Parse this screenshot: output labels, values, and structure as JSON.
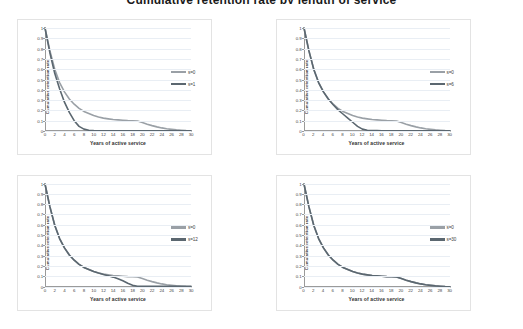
{
  "page": {
    "title": "Cumulative retention rate by length of service",
    "background": "#ffffff"
  },
  "axis": {
    "y_title": "Cumulative retention rate",
    "x_title": "Years of active service",
    "y_ticks": [
      "1",
      "0.9",
      "0.8",
      "0.7",
      "0.6",
      "0.5",
      "0.4",
      "0.3",
      "0.2",
      "0.1",
      "0"
    ],
    "x_ticks": [
      "0",
      "2",
      "4",
      "6",
      "8",
      "10",
      "12",
      "14",
      "16",
      "18",
      "20",
      "22",
      "24",
      "26",
      "28",
      "30"
    ],
    "ylim": [
      0,
      1
    ],
    "xlim": [
      0,
      30
    ],
    "grid": true
  },
  "colors": {
    "series_a": "#9aa0a6",
    "series_b": "#5b6770",
    "gridline": "#e9eef4",
    "axis": "#9a9a9a",
    "frame": "#e3e3e3",
    "text": "#3f3f3f"
  },
  "chart_data": [
    {
      "type": "line",
      "panel": "top-left",
      "title": "",
      "xlabel": "Years of active service",
      "ylabel": "Cumulative retention rate",
      "xlim": [
        0,
        30
      ],
      "ylim": [
        0,
        1
      ],
      "grid": true,
      "legend_position": "right",
      "x": [
        0,
        1,
        2,
        3,
        4,
        5,
        6,
        7,
        8,
        9,
        10,
        11,
        12,
        13,
        14,
        15,
        16,
        17,
        18,
        19,
        20,
        21,
        22,
        23,
        24,
        25,
        26,
        27,
        28,
        29,
        30
      ],
      "series": [
        {
          "name": "s=0",
          "color": "#9aa0a6",
          "values": [
            1.0,
            0.78,
            0.6,
            0.47,
            0.38,
            0.31,
            0.26,
            0.22,
            0.19,
            0.17,
            0.15,
            0.135,
            0.125,
            0.118,
            0.112,
            0.108,
            0.104,
            0.101,
            0.099,
            0.097,
            0.082,
            0.066,
            0.052,
            0.04,
            0.03,
            0.022,
            0.016,
            0.011,
            0.007,
            0.004,
            0.002
          ]
        },
        {
          "name": "s=1",
          "color": "#5b6770",
          "values": [
            1.0,
            0.76,
            0.56,
            0.41,
            0.28,
            0.18,
            0.1,
            0.045,
            0.018,
            0.008,
            0.004,
            0.003,
            0.002,
            0.002,
            0.002,
            0.002,
            0.002,
            0.002,
            0.002,
            0.002,
            0.002,
            0.002,
            0.002,
            0.002,
            0.002,
            0.002,
            0.002,
            0.002,
            0.002,
            0.002,
            0.002
          ]
        }
      ]
    },
    {
      "type": "line",
      "panel": "top-right",
      "title": "",
      "xlabel": "Years of active service",
      "ylabel": "Cumulative retention rate",
      "xlim": [
        0,
        30
      ],
      "ylim": [
        0,
        1
      ],
      "grid": true,
      "legend_position": "right",
      "x": [
        0,
        1,
        2,
        3,
        4,
        5,
        6,
        7,
        8,
        9,
        10,
        11,
        12,
        13,
        14,
        15,
        16,
        17,
        18,
        19,
        20,
        21,
        22,
        23,
        24,
        25,
        26,
        27,
        28,
        29,
        30
      ],
      "series": [
        {
          "name": "s=0",
          "color": "#9aa0a6",
          "values": [
            1.0,
            0.78,
            0.6,
            0.47,
            0.38,
            0.31,
            0.26,
            0.22,
            0.19,
            0.17,
            0.15,
            0.135,
            0.125,
            0.118,
            0.112,
            0.108,
            0.104,
            0.101,
            0.099,
            0.097,
            0.082,
            0.066,
            0.052,
            0.04,
            0.03,
            0.022,
            0.016,
            0.011,
            0.007,
            0.004,
            0.002
          ]
        },
        {
          "name": "s=6",
          "color": "#5b6770",
          "values": [
            1.0,
            0.78,
            0.6,
            0.47,
            0.38,
            0.31,
            0.255,
            0.205,
            0.165,
            0.125,
            0.085,
            0.045,
            0.018,
            0.008,
            0.005,
            0.004,
            0.003,
            0.003,
            0.003,
            0.003,
            0.003,
            0.003,
            0.003,
            0.003,
            0.003,
            0.003,
            0.003,
            0.003,
            0.003,
            0.003,
            0.003
          ]
        }
      ]
    },
    {
      "type": "line",
      "panel": "bottom-left",
      "title": "",
      "xlabel": "Years of active service",
      "ylabel": "Cumulative retention rate",
      "xlim": [
        0,
        30
      ],
      "ylim": [
        0,
        1
      ],
      "grid": true,
      "legend_position": "right",
      "x": [
        0,
        1,
        2,
        3,
        4,
        5,
        6,
        7,
        8,
        9,
        10,
        11,
        12,
        13,
        14,
        15,
        16,
        17,
        18,
        19,
        20,
        21,
        22,
        23,
        24,
        25,
        26,
        27,
        28,
        29,
        30
      ],
      "series": [
        {
          "name": "s=0",
          "color": "#9aa0a6",
          "values": [
            1.0,
            0.78,
            0.6,
            0.47,
            0.38,
            0.31,
            0.26,
            0.22,
            0.19,
            0.17,
            0.15,
            0.135,
            0.125,
            0.118,
            0.112,
            0.108,
            0.104,
            0.101,
            0.099,
            0.097,
            0.082,
            0.066,
            0.052,
            0.04,
            0.03,
            0.022,
            0.016,
            0.011,
            0.007,
            0.004,
            0.002
          ]
        },
        {
          "name": "s=12",
          "color": "#5b6770",
          "values": [
            1.0,
            0.78,
            0.6,
            0.47,
            0.38,
            0.31,
            0.26,
            0.22,
            0.19,
            0.17,
            0.15,
            0.135,
            0.122,
            0.11,
            0.096,
            0.08,
            0.06,
            0.036,
            0.016,
            0.008,
            0.006,
            0.006,
            0.006,
            0.006,
            0.006,
            0.006,
            0.006,
            0.006,
            0.006,
            0.006,
            0.006
          ]
        }
      ]
    },
    {
      "type": "line",
      "panel": "bottom-right",
      "title": "",
      "xlabel": "Years of active service",
      "ylabel": "Cumulative retention rate",
      "xlim": [
        0,
        30
      ],
      "ylim": [
        0,
        1
      ],
      "grid": true,
      "legend_position": "right",
      "x": [
        0,
        1,
        2,
        3,
        4,
        5,
        6,
        7,
        8,
        9,
        10,
        11,
        12,
        13,
        14,
        15,
        16,
        17,
        18,
        19,
        20,
        21,
        22,
        23,
        24,
        25,
        26,
        27,
        28,
        29,
        30
      ],
      "series": [
        {
          "name": "s=0",
          "color": "#9aa0a6",
          "values": [
            1.0,
            0.78,
            0.6,
            0.47,
            0.38,
            0.31,
            0.26,
            0.22,
            0.19,
            0.17,
            0.15,
            0.135,
            0.125,
            0.118,
            0.112,
            0.108,
            0.104,
            0.101,
            0.099,
            0.097,
            0.082,
            0.066,
            0.052,
            0.04,
            0.03,
            0.022,
            0.016,
            0.011,
            0.007,
            0.004,
            0.002
          ]
        },
        {
          "name": "s=30",
          "color": "#5b6770",
          "values": [
            1.0,
            0.78,
            0.6,
            0.47,
            0.38,
            0.31,
            0.26,
            0.22,
            0.19,
            0.17,
            0.15,
            0.135,
            0.125,
            0.118,
            0.112,
            0.108,
            0.104,
            0.101,
            0.099,
            0.097,
            0.082,
            0.066,
            0.052,
            0.04,
            0.03,
            0.022,
            0.016,
            0.011,
            0.007,
            0.004,
            0.002
          ]
        }
      ]
    }
  ]
}
